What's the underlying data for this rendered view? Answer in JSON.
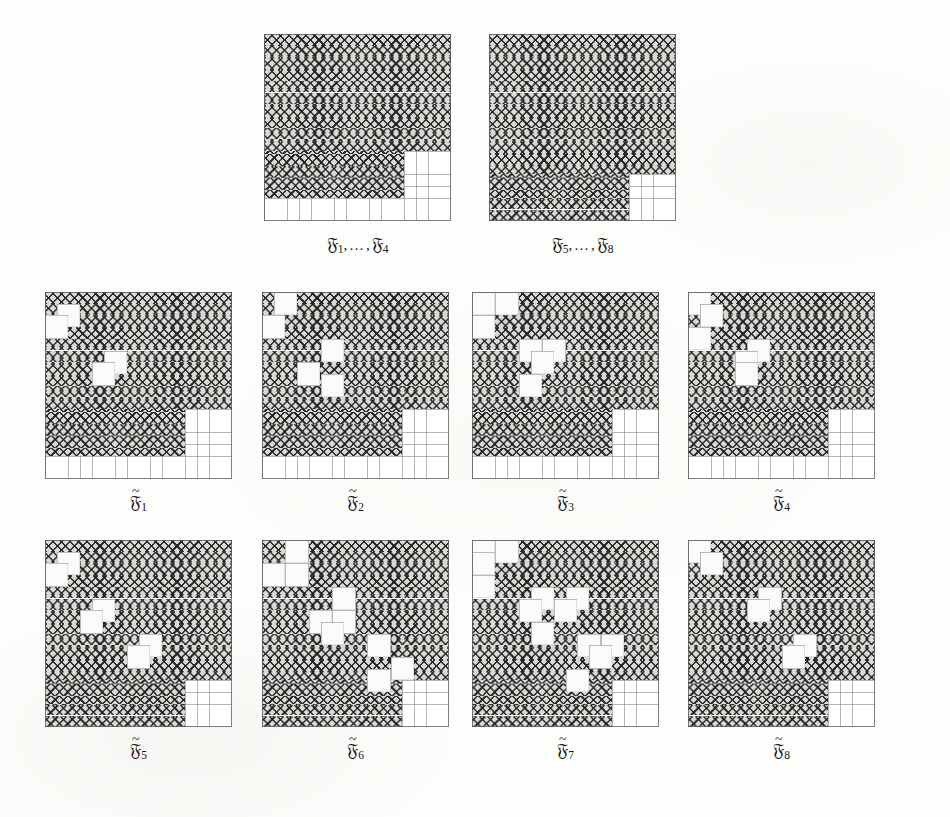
{
  "figure": {
    "background_color": "#fdfdfb",
    "hatch_color": "#1e1e1e",
    "hatch_fill_color": "#d8d8d4",
    "grid_line_color": "#787876",
    "grid_size": 16,
    "cell_px": 11.7,
    "rows": [
      {
        "id": "row-1",
        "panels": [
          {
            "id": "panel-F1-F4",
            "label": {
              "tilde": false,
              "text": "ℳ",
              "prefix_sub": "1",
              "suffix_sub": "4",
              "display": "F1,...,F4"
            },
            "x": 264,
            "y": 34,
            "shape": "A",
            "holes": []
          },
          {
            "id": "panel-F5-F8",
            "label": {
              "tilde": false,
              "text": "ℳ",
              "prefix_sub": "5",
              "suffix_sub": "8",
              "display": "F5,...,F8"
            },
            "x": 489,
            "y": 34,
            "shape": "B",
            "holes": []
          }
        ]
      },
      {
        "id": "row-2",
        "panels": [
          {
            "id": "panel-Ft1",
            "label": {
              "tilde": true,
              "sub": "1",
              "display": "F~1"
            },
            "x": 45,
            "y": 292,
            "shape": "A",
            "holes": [
              [
                1,
                1
              ],
              [
                0,
                2
              ],
              [
                5,
                5
              ],
              [
                4,
                6
              ]
            ]
          },
          {
            "id": "panel-Ft2",
            "label": {
              "tilde": true,
              "sub": "2",
              "display": "F~2"
            },
            "x": 262,
            "y": 292,
            "shape": "A",
            "holes": [
              [
                1,
                0
              ],
              [
                0,
                2
              ],
              [
                5,
                4
              ],
              [
                3,
                6
              ],
              [
                5,
                7
              ]
            ]
          },
          {
            "id": "panel-Ft3",
            "label": {
              "tilde": true,
              "sub": "3",
              "display": "F~3"
            },
            "x": 472,
            "y": 292,
            "shape": "A",
            "holes": [
              [
                0,
                0
              ],
              [
                2,
                0
              ],
              [
                0,
                2
              ],
              [
                4,
                4
              ],
              [
                6,
                4
              ],
              [
                5,
                5
              ],
              [
                4,
                7
              ]
            ]
          },
          {
            "id": "panel-Ft4",
            "label": {
              "tilde": true,
              "sub": "4",
              "display": "F~4"
            },
            "x": 688,
            "y": 292,
            "shape": "A",
            "holes": [
              [
                0,
                0
              ],
              [
                1,
                1
              ],
              [
                0,
                3
              ],
              [
                5,
                4
              ],
              [
                4,
                5
              ],
              [
                4,
                6
              ]
            ]
          }
        ]
      },
      {
        "id": "row-3",
        "panels": [
          {
            "id": "panel-Ft5",
            "label": {
              "tilde": true,
              "sub": "5",
              "display": "F~5"
            },
            "x": 45,
            "y": 540,
            "shape": "B",
            "holes": [
              [
                1,
                1
              ],
              [
                0,
                2
              ],
              [
                4,
                5
              ],
              [
                3,
                6
              ],
              [
                8,
                8
              ],
              [
                7,
                9
              ]
            ]
          },
          {
            "id": "panel-Ft6",
            "label": {
              "tilde": true,
              "sub": "6",
              "display": "F~6"
            },
            "x": 262,
            "y": 540,
            "shape": "B",
            "holes": [
              [
                2,
                0
              ],
              [
                0,
                2
              ],
              [
                2,
                2
              ],
              [
                6,
                4
              ],
              [
                4,
                6
              ],
              [
                6,
                6
              ],
              [
                5,
                7
              ],
              [
                9,
                8
              ],
              [
                11,
                10
              ],
              [
                9,
                11
              ]
            ]
          },
          {
            "id": "panel-Ft7",
            "label": {
              "tilde": true,
              "sub": "7",
              "display": "F~7"
            },
            "x": 472,
            "y": 540,
            "shape": "B",
            "holes": [
              [
                0,
                0
              ],
              [
                2,
                0
              ],
              [
                0,
                1
              ],
              [
                0,
                3
              ],
              [
                5,
                4
              ],
              [
                8,
                4
              ],
              [
                4,
                5
              ],
              [
                7,
                5
              ],
              [
                5,
                7
              ],
              [
                9,
                8
              ],
              [
                11,
                8
              ],
              [
                10,
                9
              ],
              [
                8,
                11
              ]
            ]
          },
          {
            "id": "panel-Ft8",
            "label": {
              "tilde": true,
              "sub": "8",
              "display": "F~8"
            },
            "x": 688,
            "y": 540,
            "shape": "B",
            "holes": [
              [
                0,
                0
              ],
              [
                1,
                1
              ],
              [
                6,
                4
              ],
              [
                5,
                5
              ],
              [
                9,
                8
              ],
              [
                8,
                9
              ]
            ]
          }
        ]
      }
    ],
    "shapes": {
      "A": {
        "description": "staircase region: cols 0-15 rows 0-9 minus right block, narrow lower part",
        "row_extents": [
          16,
          16,
          16,
          16,
          16,
          16,
          16,
          16,
          16,
          16,
          12,
          12,
          12,
          12,
          0,
          0
        ],
        "row_extents_note": "number of filled cells from left in each row"
      },
      "B": {
        "description": "full square minus 4x4 white notch at bottom right",
        "row_extents": [
          16,
          16,
          16,
          16,
          16,
          16,
          16,
          16,
          16,
          16,
          16,
          16,
          12,
          12,
          12,
          12
        ]
      }
    }
  },
  "ghosts": [
    {
      "text": "",
      "x": 0,
      "y": 0
    }
  ]
}
